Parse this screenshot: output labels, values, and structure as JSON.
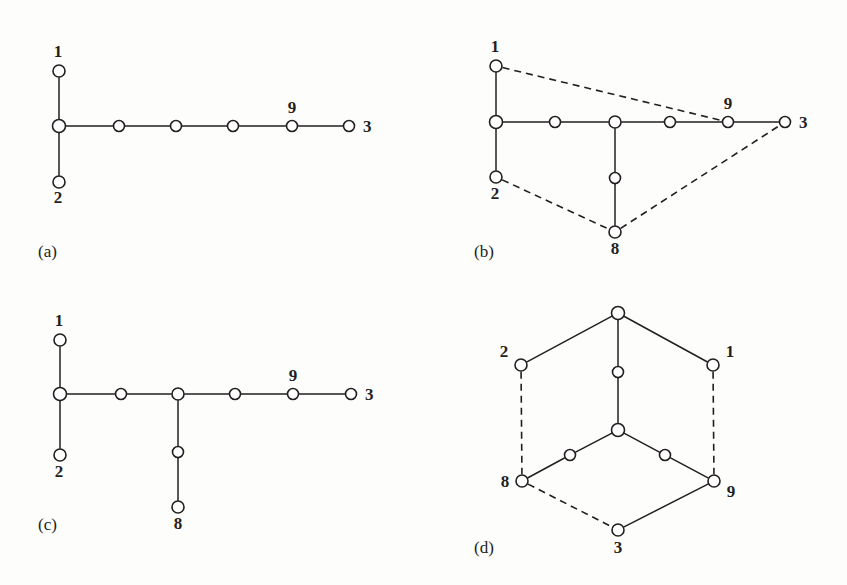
{
  "figure": {
    "background_color": "#fdfdfc",
    "ink_color": "#231f20",
    "node_fill": "#ffffff",
    "width": 847,
    "height": 585
  },
  "panels": [
    {
      "id": "a",
      "caption": "(a)",
      "caption_pos": {
        "x": 38,
        "y": 257
      },
      "nodes": [
        {
          "id": "a-n1",
          "x": 59,
          "y": 71,
          "r": 6.0,
          "label": "1",
          "label_dx": -1,
          "label_dy": -14,
          "label_anchor": "middle"
        },
        {
          "id": "a-hub",
          "x": 59,
          "y": 126,
          "r": 6.5,
          "label": "",
          "label_dx": 0,
          "label_dy": 0,
          "label_anchor": "middle"
        },
        {
          "id": "a-n2",
          "x": 59,
          "y": 182,
          "r": 6.0,
          "label": "2",
          "label_dx": -1,
          "label_dy": 21,
          "label_anchor": "middle"
        },
        {
          "id": "a-c1",
          "x": 119,
          "y": 126,
          "r": 5.5,
          "label": "",
          "label_dx": 0,
          "label_dy": 0,
          "label_anchor": "middle"
        },
        {
          "id": "a-c2",
          "x": 176,
          "y": 126,
          "r": 5.5,
          "label": "",
          "label_dx": 0,
          "label_dy": 0,
          "label_anchor": "middle"
        },
        {
          "id": "a-c3",
          "x": 233,
          "y": 126,
          "r": 5.5,
          "label": "",
          "label_dx": 0,
          "label_dy": 0,
          "label_anchor": "middle"
        },
        {
          "id": "a-n9",
          "x": 292,
          "y": 126,
          "r": 5.5,
          "label": "9",
          "label_dx": 0,
          "label_dy": -13,
          "label_anchor": "middle"
        },
        {
          "id": "a-n3",
          "x": 349,
          "y": 126,
          "r": 5.5,
          "label": "3",
          "label_dx": 14,
          "label_dy": 6,
          "label_anchor": "start"
        }
      ],
      "edges": [
        {
          "from": "a-n1",
          "to": "a-hub",
          "style": "solid"
        },
        {
          "from": "a-hub",
          "to": "a-n2",
          "style": "solid"
        },
        {
          "from": "a-hub",
          "to": "a-c1",
          "style": "solid"
        },
        {
          "from": "a-c1",
          "to": "a-c2",
          "style": "solid"
        },
        {
          "from": "a-c2",
          "to": "a-c3",
          "style": "solid"
        },
        {
          "from": "a-c3",
          "to": "a-n9",
          "style": "solid"
        },
        {
          "from": "a-n9",
          "to": "a-n3",
          "style": "solid"
        }
      ]
    },
    {
      "id": "b",
      "caption": "(b)",
      "caption_pos": {
        "x": 474,
        "y": 257
      },
      "nodes": [
        {
          "id": "b-n1",
          "x": 496,
          "y": 66,
          "r": 6.0,
          "label": "1",
          "label_dx": -1,
          "label_dy": -14,
          "label_anchor": "middle"
        },
        {
          "id": "b-hub",
          "x": 496,
          "y": 122,
          "r": 6.5,
          "label": "",
          "label_dx": 0,
          "label_dy": 0,
          "label_anchor": "middle"
        },
        {
          "id": "b-n2",
          "x": 496,
          "y": 177,
          "r": 6.0,
          "label": "2",
          "label_dx": -1,
          "label_dy": 22,
          "label_anchor": "middle"
        },
        {
          "id": "b-c1",
          "x": 555,
          "y": 122,
          "r": 5.5,
          "label": "",
          "label_dx": 0,
          "label_dy": 0,
          "label_anchor": "middle"
        },
        {
          "id": "b-br",
          "x": 615,
          "y": 122,
          "r": 6.0,
          "label": "",
          "label_dx": 0,
          "label_dy": 0,
          "label_anchor": "middle"
        },
        {
          "id": "b-c3",
          "x": 670,
          "y": 122,
          "r": 5.5,
          "label": "",
          "label_dx": 0,
          "label_dy": 0,
          "label_anchor": "middle"
        },
        {
          "id": "b-n9",
          "x": 728,
          "y": 122,
          "r": 5.5,
          "label": "9",
          "label_dx": 0,
          "label_dy": -13,
          "label_anchor": "middle"
        },
        {
          "id": "b-n3",
          "x": 785,
          "y": 122,
          "r": 5.5,
          "label": "3",
          "label_dx": 14,
          "label_dy": 6,
          "label_anchor": "start"
        },
        {
          "id": "b-mid",
          "x": 615,
          "y": 178,
          "r": 5.5,
          "label": "",
          "label_dx": 0,
          "label_dy": 0,
          "label_anchor": "middle"
        },
        {
          "id": "b-n8",
          "x": 615,
          "y": 232,
          "r": 6.0,
          "label": "8",
          "label_dx": 0,
          "label_dy": 22,
          "label_anchor": "middle"
        }
      ],
      "edges": [
        {
          "from": "b-n1",
          "to": "b-hub",
          "style": "solid"
        },
        {
          "from": "b-hub",
          "to": "b-n2",
          "style": "solid"
        },
        {
          "from": "b-hub",
          "to": "b-c1",
          "style": "solid"
        },
        {
          "from": "b-c1",
          "to": "b-br",
          "style": "solid"
        },
        {
          "from": "b-br",
          "to": "b-c3",
          "style": "solid"
        },
        {
          "from": "b-c3",
          "to": "b-n9",
          "style": "solid"
        },
        {
          "from": "b-n9",
          "to": "b-n3",
          "style": "solid"
        },
        {
          "from": "b-br",
          "to": "b-mid",
          "style": "solid"
        },
        {
          "from": "b-mid",
          "to": "b-n8",
          "style": "solid"
        },
        {
          "from": "b-n1",
          "to": "b-n9",
          "style": "dashed"
        },
        {
          "from": "b-n2",
          "to": "b-n8",
          "style": "dashed"
        },
        {
          "from": "b-n8",
          "to": "b-n3",
          "style": "dashed"
        }
      ]
    },
    {
      "id": "c",
      "caption": "(c)",
      "caption_pos": {
        "x": 38,
        "y": 530
      },
      "nodes": [
        {
          "id": "c-n1",
          "x": 60,
          "y": 340,
          "r": 6.0,
          "label": "1",
          "label_dx": -1,
          "label_dy": -14,
          "label_anchor": "middle"
        },
        {
          "id": "c-hub",
          "x": 60,
          "y": 394,
          "r": 6.5,
          "label": "",
          "label_dx": 0,
          "label_dy": 0,
          "label_anchor": "middle"
        },
        {
          "id": "c-n2",
          "x": 60,
          "y": 455,
          "r": 6.0,
          "label": "2",
          "label_dx": -1,
          "label_dy": 22,
          "label_anchor": "middle"
        },
        {
          "id": "c-c1",
          "x": 121,
          "y": 394,
          "r": 5.5,
          "label": "",
          "label_dx": 0,
          "label_dy": 0,
          "label_anchor": "middle"
        },
        {
          "id": "c-br",
          "x": 178,
          "y": 394,
          "r": 6.0,
          "label": "",
          "label_dx": 0,
          "label_dy": 0,
          "label_anchor": "middle"
        },
        {
          "id": "c-c3",
          "x": 235,
          "y": 394,
          "r": 5.5,
          "label": "",
          "label_dx": 0,
          "label_dy": 0,
          "label_anchor": "middle"
        },
        {
          "id": "c-n9",
          "x": 293,
          "y": 394,
          "r": 5.5,
          "label": "9",
          "label_dx": 0,
          "label_dy": -13,
          "label_anchor": "middle"
        },
        {
          "id": "c-n3",
          "x": 351,
          "y": 394,
          "r": 5.5,
          "label": "3",
          "label_dx": 14,
          "label_dy": 6,
          "label_anchor": "start"
        },
        {
          "id": "c-mid",
          "x": 178,
          "y": 452,
          "r": 5.5,
          "label": "",
          "label_dx": 0,
          "label_dy": 0,
          "label_anchor": "middle"
        },
        {
          "id": "c-n8",
          "x": 178,
          "y": 507,
          "r": 6.0,
          "label": "8",
          "label_dx": 0,
          "label_dy": 22,
          "label_anchor": "middle"
        }
      ],
      "edges": [
        {
          "from": "c-n1",
          "to": "c-hub",
          "style": "solid"
        },
        {
          "from": "c-hub",
          "to": "c-n2",
          "style": "solid"
        },
        {
          "from": "c-hub",
          "to": "c-c1",
          "style": "solid"
        },
        {
          "from": "c-c1",
          "to": "c-br",
          "style": "solid"
        },
        {
          "from": "c-br",
          "to": "c-c3",
          "style": "solid"
        },
        {
          "from": "c-c3",
          "to": "c-n9",
          "style": "solid"
        },
        {
          "from": "c-n9",
          "to": "c-n3",
          "style": "solid"
        },
        {
          "from": "c-br",
          "to": "c-mid",
          "style": "solid"
        },
        {
          "from": "c-mid",
          "to": "c-n8",
          "style": "solid"
        }
      ]
    },
    {
      "id": "d",
      "caption": "(d)",
      "caption_pos": {
        "x": 474,
        "y": 553
      },
      "nodes": [
        {
          "id": "d-top",
          "x": 618,
          "y": 313,
          "r": 6.5,
          "label": "",
          "label_dx": 0,
          "label_dy": 0,
          "label_anchor": "middle"
        },
        {
          "id": "d-n2",
          "x": 521,
          "y": 365,
          "r": 6.0,
          "label": "2",
          "label_dx": -17,
          "label_dy": -8,
          "label_anchor": "middle"
        },
        {
          "id": "d-n1",
          "x": 713,
          "y": 365,
          "r": 6.0,
          "label": "1",
          "label_dx": 17,
          "label_dy": -8,
          "label_anchor": "middle"
        },
        {
          "id": "d-vmid",
          "x": 618,
          "y": 372,
          "r": 5.5,
          "label": "",
          "label_dx": 0,
          "label_dy": 0,
          "label_anchor": "middle"
        },
        {
          "id": "d-ctr",
          "x": 618,
          "y": 430,
          "r": 6.5,
          "label": "",
          "label_dx": 0,
          "label_dy": 0,
          "label_anchor": "middle"
        },
        {
          "id": "d-lmid",
          "x": 570,
          "y": 455,
          "r": 5.5,
          "label": "",
          "label_dx": 0,
          "label_dy": 0,
          "label_anchor": "middle"
        },
        {
          "id": "d-rmid",
          "x": 665,
          "y": 455,
          "r": 5.5,
          "label": "",
          "label_dx": 0,
          "label_dy": 0,
          "label_anchor": "middle"
        },
        {
          "id": "d-n8",
          "x": 522,
          "y": 481,
          "r": 6.0,
          "label": "8",
          "label_dx": -17,
          "label_dy": 6,
          "label_anchor": "middle"
        },
        {
          "id": "d-n9",
          "x": 714,
          "y": 481,
          "r": 6.0,
          "label": "9",
          "label_dx": 17,
          "label_dy": 16,
          "label_anchor": "middle"
        },
        {
          "id": "d-n3",
          "x": 618,
          "y": 530,
          "r": 6.0,
          "label": "3",
          "label_dx": 0,
          "label_dy": 23,
          "label_anchor": "middle"
        }
      ],
      "edges": [
        {
          "from": "d-top",
          "to": "d-n2",
          "style": "solid"
        },
        {
          "from": "d-top",
          "to": "d-n1",
          "style": "solid"
        },
        {
          "from": "d-top",
          "to": "d-vmid",
          "style": "solid"
        },
        {
          "from": "d-vmid",
          "to": "d-ctr",
          "style": "solid"
        },
        {
          "from": "d-ctr",
          "to": "d-lmid",
          "style": "solid"
        },
        {
          "from": "d-lmid",
          "to": "d-n8",
          "style": "solid"
        },
        {
          "from": "d-ctr",
          "to": "d-rmid",
          "style": "solid"
        },
        {
          "from": "d-rmid",
          "to": "d-n9",
          "style": "solid"
        },
        {
          "from": "d-n9",
          "to": "d-n3",
          "style": "solid"
        },
        {
          "from": "d-n2",
          "to": "d-n8",
          "style": "dashed"
        },
        {
          "from": "d-n1",
          "to": "d-n9",
          "style": "dashed"
        },
        {
          "from": "d-n8",
          "to": "d-n3",
          "style": "dashed"
        }
      ]
    }
  ]
}
